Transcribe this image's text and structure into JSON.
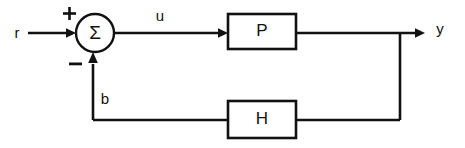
{
  "diagram": {
    "type": "control-system-block-diagram",
    "colors": {
      "line": "#111111",
      "background": "#ffffff",
      "text": "#111111"
    },
    "signals": {
      "reference": "r",
      "control": "u",
      "output": "y",
      "feedback": "b"
    },
    "summing_junction": {
      "symbol": "Σ",
      "plus_sign": "+",
      "minus_sign": "−"
    },
    "blocks": [
      {
        "id": "plant",
        "label": "P"
      },
      {
        "id": "feedback",
        "label": "H"
      }
    ]
  }
}
